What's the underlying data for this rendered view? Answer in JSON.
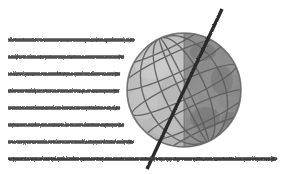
{
  "figure": {
    "type": "diagram",
    "width": 287,
    "height": 174,
    "background_color": "#ffffff"
  },
  "colors": {
    "background": "#ffffff",
    "arrow": "#4f4f4f",
    "arrow_dark": "#3c3c3c",
    "globe_lit": "#b4b4b4",
    "globe_lit_edge": "#c9c9c9",
    "globe_dark": "#7c7c7c",
    "globe_dark_edge": "#909090",
    "globe_outline": "#6b6b6b",
    "graticule": "#5e5e5e",
    "axis": "#2b2b2b",
    "mottle_dark": "#6a6a6a",
    "mottle_light": "#c4c4c4"
  },
  "globe": {
    "label": "globe",
    "center_x": 184,
    "center_y": 90,
    "radius": 57,
    "lit_side": "left",
    "dark_side": "right",
    "terminator_x": 184,
    "terminator_label": "terminator",
    "graticule": {
      "latitude_count": 5,
      "longitude_count": 5,
      "tilt_degrees": 23.5
    }
  },
  "axis": {
    "label": "rotation-axis",
    "x1": 222,
    "y1": 9,
    "x2": 147,
    "y2": 169,
    "tilt_degrees": 23.5,
    "stroke_width": 3.4
  },
  "rays": {
    "label": "incoming-sunlight-rays",
    "direction": "left-to-right",
    "count": 9,
    "items": [
      {
        "name": "ray-1",
        "y": 23,
        "x_start": 8,
        "x_end": 277,
        "passes_globe": true
      },
      {
        "name": "ray-2",
        "y": 40,
        "x_start": 8,
        "x_end": 134,
        "passes_globe": false
      },
      {
        "name": "ray-3",
        "y": 57,
        "x_start": 8,
        "x_end": 124,
        "passes_globe": false
      },
      {
        "name": "ray-4",
        "y": 74,
        "x_start": 8,
        "x_end": 120,
        "passes_globe": false
      },
      {
        "name": "ray-5",
        "y": 91,
        "x_start": 8,
        "x_end": 119,
        "passes_globe": false
      },
      {
        "name": "ray-6",
        "y": 108,
        "x_start": 8,
        "x_end": 120,
        "passes_globe": false
      },
      {
        "name": "ray-7",
        "y": 125,
        "x_start": 8,
        "x_end": 124,
        "passes_globe": false
      },
      {
        "name": "ray-8",
        "y": 142,
        "x_start": 8,
        "x_end": 134,
        "passes_globe": false
      },
      {
        "name": "ray-9",
        "y": 159,
        "x_start": 8,
        "x_end": 277,
        "passes_globe": true
      }
    ]
  }
}
